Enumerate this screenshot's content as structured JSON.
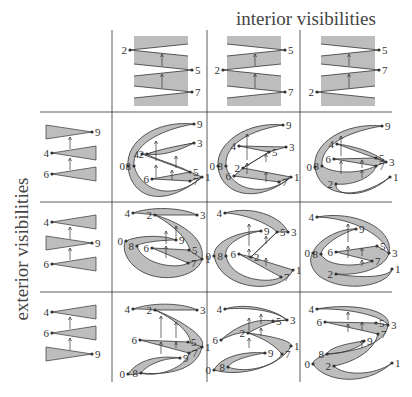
{
  "labels": {
    "top_title": "interior visibilities",
    "left_title": "exterior visibilities"
  },
  "colors": {
    "fill": "#bdbdbd",
    "stroke": "#333333",
    "grid": "#333333",
    "text": "#333333"
  },
  "grid": {
    "vertical_lines_x": [
      112,
      207,
      300
    ],
    "horizontal_lines_y": [
      112,
      202,
      292
    ],
    "v_extent": [
      30,
      382
    ],
    "h_extent": [
      15,
      392
    ]
  },
  "column_headers": [
    {
      "column": 1,
      "order_top_to_bottom": [
        "2",
        "5",
        "7"
      ],
      "label_sides": [
        "left",
        "right",
        "right"
      ]
    },
    {
      "column": 2,
      "order_top_to_bottom": [
        "5",
        "2",
        "7"
      ],
      "label_sides": [
        "right",
        "left",
        "right"
      ]
    },
    {
      "column": 3,
      "order_top_to_bottom": [
        "5",
        "7",
        "2"
      ],
      "label_sides": [
        "right",
        "right",
        "left"
      ]
    }
  ],
  "row_headers": [
    {
      "row": 1,
      "order_top_to_bottom": [
        "9",
        "4",
        "6"
      ],
      "label_sides": [
        "right",
        "left",
        "left"
      ]
    },
    {
      "row": 2,
      "order_top_to_bottom": [
        "4",
        "9",
        "6"
      ],
      "label_sides": [
        "left",
        "right",
        "left"
      ]
    },
    {
      "row": 3,
      "order_top_to_bottom": [
        "4",
        "6",
        "9"
      ],
      "label_sides": [
        "left",
        "left",
        "right"
      ]
    }
  ],
  "cells": [
    {
      "row": 1,
      "col": 1,
      "vertices": [
        "0",
        "1",
        "2",
        "3",
        "4",
        "5",
        "6",
        "7",
        "8",
        "9"
      ]
    },
    {
      "row": 1,
      "col": 2,
      "vertices": [
        "0",
        "1",
        "2",
        "3",
        "4",
        "5",
        "6",
        "7",
        "8",
        "9"
      ]
    },
    {
      "row": 1,
      "col": 3,
      "vertices": [
        "0",
        "1",
        "2",
        "3",
        "4",
        "5",
        "6",
        "7",
        "8",
        "9"
      ]
    },
    {
      "row": 2,
      "col": 1,
      "vertices": [
        "0",
        "1",
        "2",
        "3",
        "4",
        "5",
        "6",
        "7",
        "8",
        "9"
      ]
    },
    {
      "row": 2,
      "col": 2,
      "vertices": [
        "0",
        "1",
        "2",
        "3",
        "4",
        "5",
        "6",
        "7",
        "8",
        "9"
      ]
    },
    {
      "row": 2,
      "col": 3,
      "vertices": [
        "0",
        "1",
        "2",
        "3",
        "4",
        "5",
        "6",
        "7",
        "8",
        "9"
      ]
    },
    {
      "row": 3,
      "col": 1,
      "vertices": [
        "0",
        "1",
        "2",
        "3",
        "4",
        "5",
        "6",
        "7",
        "8",
        "9"
      ]
    },
    {
      "row": 3,
      "col": 2,
      "vertices": [
        "0",
        "1",
        "2",
        "3",
        "4",
        "5",
        "6",
        "7",
        "8",
        "9"
      ]
    },
    {
      "row": 3,
      "col": 3,
      "vertices": [
        "0",
        "1",
        "2",
        "3",
        "4",
        "5",
        "6",
        "7",
        "8",
        "9"
      ]
    }
  ]
}
